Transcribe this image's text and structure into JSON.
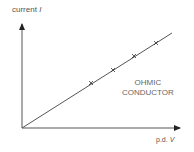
{
  "diagram": {
    "title": "",
    "y_axis": {
      "label": "current",
      "symbol": "I"
    },
    "x_axis": {
      "label": "p.d.",
      "symbol": "V"
    },
    "annotation": {
      "line1": "OHMIC",
      "line2": "CONDUCTOR"
    },
    "line_color": "#555555",
    "markers": [
      {
        "x": 91,
        "y": 83
      },
      {
        "x": 113,
        "y": 70
      },
      {
        "x": 134,
        "y": 56
      },
      {
        "x": 156,
        "y": 43
      }
    ]
  }
}
